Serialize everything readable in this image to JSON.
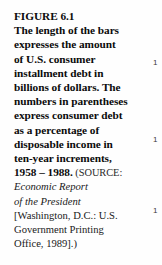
{
  "figure": {
    "label": "FIGURE 6.1",
    "caption_lines": [
      "The length of the bars",
      "expresses the amount",
      "of U.S. consumer",
      "installment debt in",
      "billions of dollars. The",
      "numbers in parentheses",
      "express consumer debt",
      "as a percentage of",
      "disposable income in",
      "ten-year increments,"
    ],
    "date_range": "1958 – 1988.",
    "source_opener": "(",
    "source_word": "SOURCE",
    "source_colon": ":",
    "source_lines": [
      {
        "text": "Economic Report",
        "style": "italic"
      },
      {
        "text": "of the President",
        "style": "italic"
      },
      {
        "text": "[Washington, D.C.: U.S.",
        "style": "roman"
      },
      {
        "text": "Government Printing",
        "style": "roman"
      },
      {
        "text": "Office, 1989].)",
        "style": "roman"
      }
    ]
  },
  "chart_axis_ticks": [
    {
      "label": "1",
      "top": 59
    },
    {
      "label": "1",
      "top": 136
    },
    {
      "label": "1",
      "top": 207
    }
  ],
  "colors": {
    "background": "#fefefe",
    "text": "#111111",
    "source_text": "#202020",
    "tick_text": "#3a3a3a"
  }
}
